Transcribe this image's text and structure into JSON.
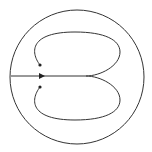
{
  "diagram": {
    "background": "#ffffff",
    "stroke_color": "#333333",
    "outer_circle": {
      "cx": 77,
      "cy": 77,
      "r": 67
    },
    "center_line": {
      "x1": 11,
      "y1": 76,
      "x2": 86,
      "y2": 76
    },
    "loops": [
      {
        "name": "upper-loop",
        "path": "M40,65 C30,52 30,32 75,32 C105,32 120,40 120,52 C120,66 100,76 86,76"
      },
      {
        "name": "lower-loop",
        "path": "M40,87 C30,100 30,120 75,120 C105,120 120,112 120,100 C120,86 100,76 86,76"
      }
    ],
    "arrowheads": [
      {
        "name": "center-arrow",
        "x": 42,
        "y": 76
      },
      {
        "name": "upper-arrow",
        "x": 40,
        "y": 65
      },
      {
        "name": "lower-arrow",
        "x": 40,
        "y": 87
      }
    ]
  }
}
